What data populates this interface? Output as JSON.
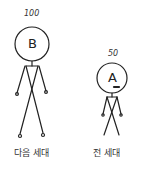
{
  "figures": [
    {
      "id": "B",
      "letter": "B",
      "value": "100",
      "label": "다음 세대",
      "mark": "",
      "height_px": 120
    },
    {
      "id": "A",
      "letter": "A",
      "value": "50",
      "label": "전 세대",
      "mark": "minus",
      "height_px": 70
    }
  ],
  "colors": {
    "stroke": "#222222",
    "background": "#ffffff"
  }
}
